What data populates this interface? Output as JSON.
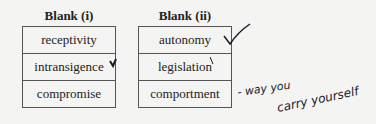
{
  "blank_i": {
    "header": "Blank (i)",
    "options": [
      "receptivity",
      "intransigence",
      "compromise"
    ]
  },
  "blank_ii": {
    "header": "Blank (ii)",
    "options": [
      "autonomy",
      "legislation",
      "comportment"
    ]
  },
  "annotations": {
    "checkmark_target": "autonomy",
    "handwritten_note": "- way you carry yourself",
    "ink_color": "#1a1a2e"
  }
}
